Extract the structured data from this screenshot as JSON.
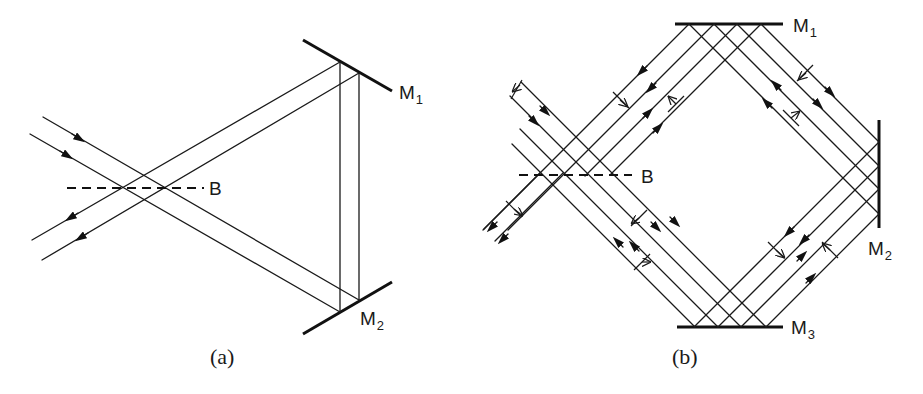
{
  "figure": {
    "panels": [
      {
        "id": "a",
        "caption": "(a)",
        "description": "Triangular ring interferometer",
        "beamsplitter": {
          "label": "B"
        },
        "mirrors": [
          {
            "label": "M",
            "subscript": "1"
          },
          {
            "label": "M",
            "subscript": "2"
          }
        ]
      },
      {
        "id": "b",
        "caption": "(b)",
        "description": "Square ring interferometer",
        "beamsplitter": {
          "label": "B"
        },
        "mirrors": [
          {
            "label": "M",
            "subscript": "1"
          },
          {
            "label": "M",
            "subscript": "2"
          },
          {
            "label": "M",
            "subscript": "3"
          }
        ]
      }
    ],
    "colors": {
      "ink": "#1a1a1a",
      "background": "#ffffff"
    }
  }
}
